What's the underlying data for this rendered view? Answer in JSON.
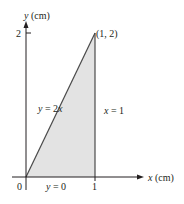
{
  "diagram": {
    "axes": {
      "x_label_var": "x",
      "x_label_unit": " (cm)",
      "y_label_var": "y",
      "y_label_unit": " (cm)",
      "origin_label": "0",
      "x_tick_label": "1",
      "y_tick_label": "2"
    },
    "region": {
      "fill_color": "#e3e3e3",
      "vertices": [
        [
          0,
          0
        ],
        [
          1,
          0
        ],
        [
          1,
          2
        ]
      ]
    },
    "lines": {
      "diagonal": {
        "equation_left": "y",
        "equation_right": " = 2",
        "equation_var": "x"
      },
      "vertical": {
        "equation_var": "x",
        "equation_right": " = 1"
      },
      "bottom": {
        "equation_var": "y",
        "equation_right": " = 0"
      }
    },
    "point": {
      "label": "(1, 2)"
    }
  }
}
